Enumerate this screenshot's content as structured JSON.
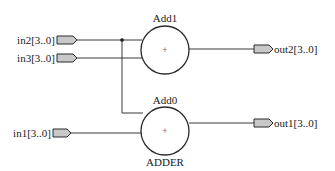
{
  "diagram": {
    "type": "RTL schematic",
    "inputs": [
      {
        "id": "in2",
        "label": "in2[3..0]",
        "y": 40
      },
      {
        "id": "in3",
        "label": "in3[3..0]",
        "y": 58
      },
      {
        "id": "in1",
        "label": "in1[3..0]",
        "y": 133
      }
    ],
    "outputs": [
      {
        "id": "out2",
        "label": "out2[3..0]",
        "y": 49
      },
      {
        "id": "out1",
        "label": "out1[3..0]",
        "y": 123
      }
    ],
    "adders": [
      {
        "id": "Add1",
        "name": "Add1",
        "symbol": "+",
        "type_label": ""
      },
      {
        "id": "Add0",
        "name": "Add0",
        "symbol": "+",
        "type_label": "ADDER"
      }
    ],
    "connections": [
      {
        "from": "in2",
        "to": "Add1"
      },
      {
        "from": "in3",
        "to": "Add1"
      },
      {
        "from": "in2",
        "to": "Add0"
      },
      {
        "from": "in1",
        "to": "Add0"
      },
      {
        "from": "Add1",
        "to": "out2"
      },
      {
        "from": "Add0",
        "to": "out1"
      }
    ],
    "colors": {
      "pin_fill": "#c8c8c8",
      "stroke": "#2a2a2a",
      "background": "#ffffff"
    }
  }
}
